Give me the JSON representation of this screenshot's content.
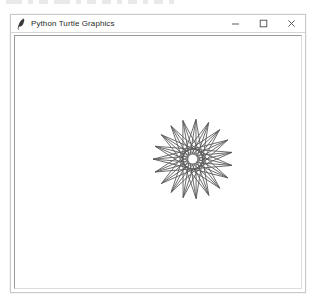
{
  "window": {
    "title": "Python Turtle Graphics",
    "icon": "python-feather-icon",
    "controls": [
      {
        "name": "minimize",
        "glyph": "–"
      },
      {
        "name": "maximize",
        "glyph": "□"
      },
      {
        "name": "close",
        "glyph": "✕"
      }
    ]
  },
  "canvas": {
    "background": "#ffffff",
    "drawing": {
      "name": "star-polygon",
      "description": "19-pointed star polygon spirograph drawn with turtle graphics",
      "stroke_color": "#5a5a5a",
      "stroke_width": 0.9,
      "center_x": 192,
      "center_y": 157,
      "outer_radius": 40,
      "points": 19,
      "step": 9,
      "hub_radius": 4.6,
      "hub_color": "#ffffff"
    }
  },
  "colors": {
    "window_border": "#c8c8c8",
    "title_text": "#2b2b2b",
    "canvas_bg": "#ffffff",
    "ink": "#5a5a5a"
  }
}
